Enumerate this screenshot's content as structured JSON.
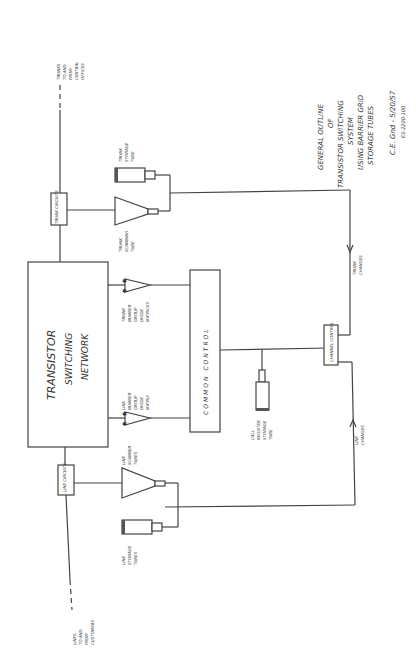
{
  "title": {
    "lines": [
      "GENERAL OUTLINE",
      "OF",
      "TRANSISTOR SWITCHING",
      "SYSTEM",
      "USING BARRIER GRID",
      "STORAGE TUBES"
    ],
    "signature": "C.E. Gnd - 5/20/57",
    "drawing_number": "ES-2200-100"
  },
  "blocks": {
    "network": "TRANSISTOR SWITCHING NETWORK",
    "network_lines": [
      "TRANSISTOR",
      "SWITCHING",
      "NETWORK"
    ],
    "common_control": "COMMON CONTROL",
    "trunk_circuits": "TRUNK CIRCUITS",
    "line_circuits": "LINE CIRCUITS",
    "channel_control": "CHANNEL CONTROL"
  },
  "labels": {
    "trunks_ext": [
      "TRUNKS",
      "TO AND",
      "FROM",
      "CENTRAL",
      "OFFICES"
    ],
    "lines_ext": [
      "LINES",
      "TO AND",
      "FROM",
      "CUSTOMERS"
    ],
    "trunk_storage_tube": [
      "TRUNK",
      "STORAGE",
      "TUBE"
    ],
    "trunk_scanning_tube": [
      "TRUNK",
      "SCANNING",
      "TUBE"
    ],
    "trunk_matrices": [
      "TRUNK",
      "NUMBER",
      "GROUP",
      "DIODE",
      "MATRICES"
    ],
    "line_matrix": [
      "LINE",
      "NUMBER",
      "GROUP",
      "DIODE",
      "MATRIX"
    ],
    "line_scanner_tubes": [
      "LINE",
      "SCANNER",
      "TUBES"
    ],
    "line_storage_tubes": [
      "LINE",
      "STORAGE",
      "TUBES"
    ],
    "call_register": [
      "CALL",
      "REGISTER",
      "STORAGE",
      "TUBE"
    ],
    "trunk_changes": [
      "TRUNK",
      "CHANGES"
    ],
    "line_changes": [
      "LINE",
      "CHANGES"
    ]
  }
}
